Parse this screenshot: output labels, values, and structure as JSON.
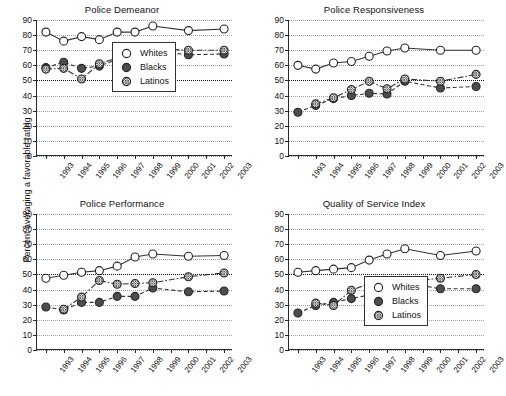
{
  "figure": {
    "ylabel": "Percent averaging a favorable rating",
    "yticks": [
      0,
      10,
      20,
      30,
      40,
      50,
      60,
      70,
      80,
      90
    ],
    "ylim": [
      0,
      90
    ],
    "reference_line": 50,
    "xticks": [
      "1993",
      "1994",
      "1995",
      "1996",
      "1997",
      "1998",
      "1999",
      "2000",
      "2001",
      "2002",
      "2003"
    ],
    "colors": {
      "whites_marker": "#ffffff",
      "blacks_marker": "#4d4d4d",
      "latinos_marker": "#e8e8e8",
      "line": "#333333",
      "grid": "#9aa3b0",
      "axis": "#2a2a2a"
    },
    "legend_labels": [
      "Whites",
      "Blacks",
      "Latinos"
    ],
    "legend_symbols": [
      "open-circle-marker",
      "filled-circle-marker",
      "hatched-circle-marker"
    ]
  },
  "chart_data": [
    {
      "type": "line",
      "title": "Police Demeanor",
      "xlabel": "",
      "ylabel": "Percent averaging a favorable rating",
      "ylim": [
        0,
        90
      ],
      "grid": true,
      "legend_position": "lower-right",
      "categories": [
        "1993",
        "1994",
        "1995",
        "1996",
        "1997",
        "1998",
        "1999",
        "2000",
        "2001",
        "2002",
        "2003"
      ],
      "series": [
        {
          "name": "Whites",
          "values": [
            82,
            76,
            79,
            77,
            82,
            82,
            86,
            null,
            83,
            null,
            84
          ]
        },
        {
          "name": "Blacks",
          "values": [
            58.5,
            62,
            58,
            59.5,
            64,
            64.5,
            69.5,
            null,
            67,
            null,
            67.5
          ]
        },
        {
          "name": "Latinos",
          "values": [
            57.5,
            58,
            51,
            61,
            65,
            65,
            71,
            null,
            70,
            null,
            70
          ]
        }
      ]
    },
    {
      "type": "line",
      "title": "Police Responsiveness",
      "xlabel": "",
      "ylabel": "Percent averaging a favorable rating",
      "ylim": [
        0,
        90
      ],
      "grid": true,
      "legend_position": "none",
      "categories": [
        "1993",
        "1994",
        "1995",
        "1996",
        "1997",
        "1998",
        "1999",
        "2000",
        "2001",
        "2002",
        "2003"
      ],
      "series": [
        {
          "name": "Whites",
          "values": [
            60,
            57.5,
            61.5,
            62.5,
            66,
            69.5,
            71.5,
            null,
            70,
            null,
            70
          ]
        },
        {
          "name": "Blacks",
          "values": [
            29,
            33.5,
            38,
            40,
            41.5,
            41,
            49.5,
            null,
            45,
            null,
            46
          ]
        },
        {
          "name": "Latinos",
          "values": [
            null,
            34.5,
            38.5,
            44,
            49.5,
            44.5,
            51,
            null,
            49.5,
            null,
            54
          ]
        }
      ]
    },
    {
      "type": "line",
      "title": "Police Performance",
      "xlabel": "",
      "ylabel": "Percent averaging a favorable rating",
      "ylim": [
        0,
        90
      ],
      "grid": true,
      "legend_position": "none",
      "categories": [
        "1993",
        "1994",
        "1995",
        "1996",
        "1997",
        "1998",
        "1999",
        "2000",
        "2001",
        "2002",
        "2003"
      ],
      "series": [
        {
          "name": "Whites",
          "values": [
            47.5,
            49.5,
            51.5,
            52.5,
            55.5,
            61.5,
            63.5,
            null,
            62,
            null,
            62.5
          ]
        },
        {
          "name": "Blacks",
          "values": [
            28.5,
            26.5,
            31.5,
            31.5,
            35.5,
            35.5,
            41,
            null,
            38.5,
            null,
            39
          ]
        },
        {
          "name": "Latinos",
          "values": [
            null,
            27,
            35,
            46,
            43.5,
            44,
            44.5,
            null,
            48.5,
            null,
            51
          ]
        }
      ]
    },
    {
      "type": "line",
      "title": "Quality of Service Index",
      "xlabel": "",
      "ylabel": "Percent averaging a favorable rating",
      "ylim": [
        0,
        90
      ],
      "grid": true,
      "legend_position": "lower-right",
      "categories": [
        "1993",
        "1994",
        "1995",
        "1996",
        "1997",
        "1998",
        "1999",
        "2000",
        "2001",
        "2002",
        "2003"
      ],
      "series": [
        {
          "name": "Whites",
          "values": [
            51.5,
            52.5,
            53.5,
            54.5,
            59.5,
            63.5,
            67,
            null,
            62.5,
            null,
            65.5
          ]
        },
        {
          "name": "Blacks",
          "values": [
            24.5,
            29.5,
            31.5,
            34,
            36.5,
            36.5,
            44.5,
            null,
            40.5,
            null,
            40.5
          ]
        },
        {
          "name": "Latinos",
          "values": [
            null,
            31,
            29.5,
            39.5,
            44,
            41.5,
            45,
            null,
            47.5,
            null,
            50
          ]
        }
      ]
    }
  ]
}
